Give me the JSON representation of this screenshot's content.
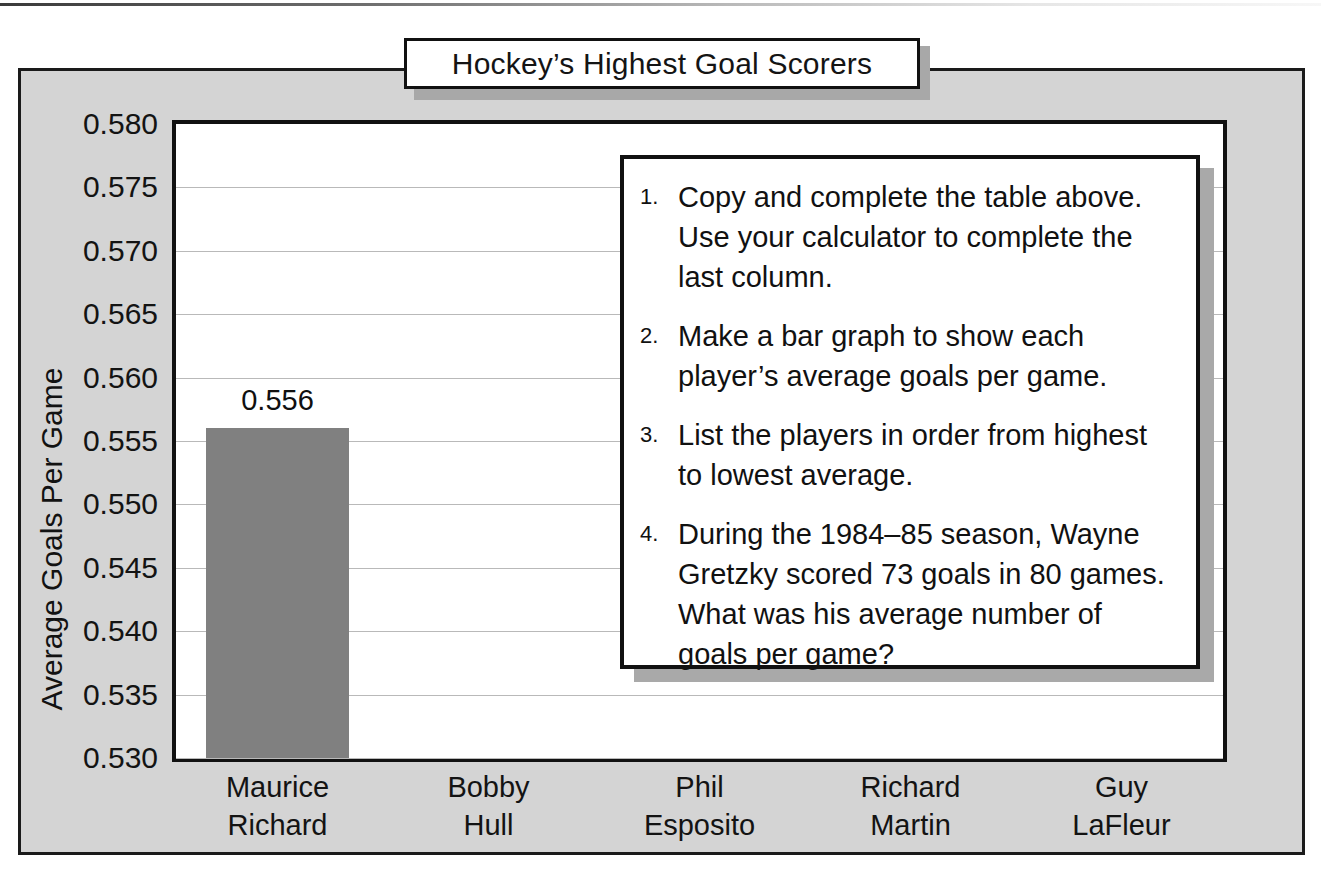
{
  "title": "Hockey’s Highest Goal Scorers",
  "axes": {
    "ylabel": "Average Goals Per Game",
    "yticks": [
      "0.580",
      "0.575",
      "0.570",
      "0.565",
      "0.560",
      "0.555",
      "0.550",
      "0.545",
      "0.540",
      "0.535",
      "0.530"
    ]
  },
  "players": [
    {
      "first": "Maurice",
      "last": "Richard"
    },
    {
      "first": "Bobby",
      "last": "Hull"
    },
    {
      "first": "Phil",
      "last": "Esposito"
    },
    {
      "first": "Richard",
      "last": "Martin"
    },
    {
      "first": "Guy",
      "last": "LaFleur"
    }
  ],
  "bar_labels": [
    "0.556"
  ],
  "tasks": [
    {
      "num": "1.",
      "text": "Copy and complete the table above. Use your calculator to complete the last column."
    },
    {
      "num": "2.",
      "text": "Make a bar graph to show each player’s average goals per game."
    },
    {
      "num": "3.",
      "text": "List the players in order from highest to lowest average."
    },
    {
      "num": "4.",
      "text": "During the 1984–85 season, Wayne Gretzky scored 73 goals in 80 games. What was his average number of goals per game?"
    }
  ],
  "colors": {
    "bar": "#808080",
    "panel": "#d4d4d4",
    "grid": "#b9b9b9",
    "shadow": "#a8a8a8"
  },
  "chart_data": {
    "type": "bar",
    "title": "Hockey’s Highest Goal Scorers",
    "xlabel": "",
    "ylabel": "Average Goals Per Game",
    "categories": [
      "Maurice Richard",
      "Bobby Hull",
      "Phil Esposito",
      "Richard Martin",
      "Guy LaFleur"
    ],
    "values": [
      0.556,
      null,
      null,
      null,
      null
    ],
    "data_labels": [
      "0.556",
      "",
      "",
      "",
      ""
    ],
    "ylim": [
      0.53,
      0.58
    ],
    "ytick_step": 0.005,
    "yticks": [
      0.53,
      0.535,
      0.54,
      0.545,
      0.55,
      0.555,
      0.56,
      0.565,
      0.57,
      0.575,
      0.58
    ],
    "grid": "horizontal",
    "legend": "none",
    "bar_color": "#808080",
    "note": "Only the first bar (Maurice Richard, 0.556) is drawn; remaining bars are left blank for the student to complete."
  }
}
